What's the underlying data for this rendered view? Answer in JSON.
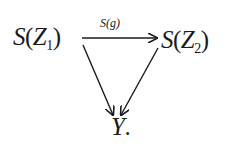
{
  "diagram": {
    "type": "commutative-diagram",
    "nodes": [
      {
        "id": "SZ1",
        "func": "S",
        "arg": "Z",
        "sub": "1",
        "suffix": ""
      },
      {
        "id": "SZ2",
        "func": "S",
        "arg": "Z",
        "sub": "2",
        "suffix": ""
      },
      {
        "id": "Y",
        "label": "Y",
        "suffix": "."
      }
    ],
    "edges": [
      {
        "from": "SZ1",
        "to": "SZ2",
        "label": "S(g)"
      },
      {
        "from": "SZ1",
        "to": "Y",
        "label": ""
      },
      {
        "from": "SZ2",
        "to": "Y",
        "label": ""
      }
    ],
    "paren_open": "(",
    "paren_close": ")",
    "stroke_color": "#1a1a1a"
  }
}
